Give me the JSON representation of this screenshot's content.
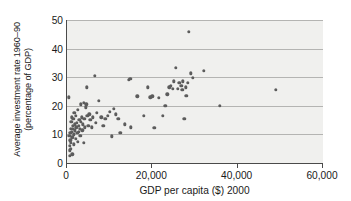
{
  "chart_data": {
    "type": "scatter",
    "title": "",
    "xlabel": "GDP per capita ($) 2000",
    "ylabel_line1": "Average investment rate 1960–90",
    "ylabel_line2": "(percentage of GDP)",
    "xlim": [
      0,
      60000
    ],
    "ylim": [
      0,
      50
    ],
    "xticks": [
      0,
      20000,
      40000,
      60000
    ],
    "xtick_labels": [
      "0",
      "20,000",
      "40,000",
      "60,000"
    ],
    "yticks": [
      0,
      10,
      20,
      30,
      40,
      50
    ],
    "ytick_labels": [
      "0",
      "10",
      "20",
      "30",
      "40",
      "50"
    ],
    "grid": "horizontal",
    "legend": "none",
    "plot_background": "#f0f0ee",
    "marker_color": "#5c5c5c",
    "gridline_color": "#b4b4b2",
    "axis_color": "#4a4a4a",
    "points": [
      [
        400,
        23.0
      ],
      [
        500,
        9.5
      ],
      [
        600,
        6.0
      ],
      [
        650,
        4.5
      ],
      [
        700,
        2.5
      ],
      [
        750,
        10.5
      ],
      [
        800,
        8.0
      ],
      [
        850,
        12.0
      ],
      [
        900,
        5.0
      ],
      [
        950,
        7.0
      ],
      [
        1000,
        14.5
      ],
      [
        1100,
        11.0
      ],
      [
        1150,
        16.0
      ],
      [
        1200,
        9.0
      ],
      [
        1250,
        3.0
      ],
      [
        1300,
        13.0
      ],
      [
        1400,
        12.0
      ],
      [
        1500,
        15.5
      ],
      [
        1550,
        10.0
      ],
      [
        1600,
        6.5
      ],
      [
        1700,
        17.5
      ],
      [
        1800,
        11.5
      ],
      [
        1900,
        13.5
      ],
      [
        2000,
        8.5
      ],
      [
        2100,
        16.5
      ],
      [
        2200,
        12.5
      ],
      [
        2300,
        14.0
      ],
      [
        2400,
        10.5
      ],
      [
        2500,
        7.5
      ],
      [
        2600,
        18.5
      ],
      [
        2700,
        13.0
      ],
      [
        2800,
        11.0
      ],
      [
        2900,
        15.0
      ],
      [
        3000,
        12.0
      ],
      [
        3100,
        9.5
      ],
      [
        3200,
        20.5
      ],
      [
        3300,
        14.5
      ],
      [
        3500,
        16.0
      ],
      [
        3600,
        11.5
      ],
      [
        3700,
        13.5
      ],
      [
        3900,
        21.0
      ],
      [
        4000,
        7.0
      ],
      [
        4100,
        15.5
      ],
      [
        4200,
        12.5
      ],
      [
        4400,
        19.5
      ],
      [
        4500,
        20.5
      ],
      [
        4700,
        26.5
      ],
      [
        4800,
        16.5
      ],
      [
        5000,
        13.0
      ],
      [
        5200,
        17.0
      ],
      [
        5500,
        15.0
      ],
      [
        5800,
        12.5
      ],
      [
        6000,
        16.0
      ],
      [
        6500,
        30.5
      ],
      [
        6800,
        14.0
      ],
      [
        7000,
        17.5
      ],
      [
        7500,
        21.8
      ],
      [
        8000,
        16.0
      ],
      [
        8500,
        13.0
      ],
      [
        9000,
        15.5
      ],
      [
        9500,
        16.5
      ],
      [
        10000,
        18.0
      ],
      [
        10500,
        9.3
      ],
      [
        11000,
        19.0
      ],
      [
        11500,
        17.0
      ],
      [
        12000,
        15.5
      ],
      [
        12500,
        10.5
      ],
      [
        13500,
        13.5
      ],
      [
        14500,
        29.0
      ],
      [
        14800,
        29.5
      ],
      [
        15000,
        12.5
      ],
      [
        16500,
        23.3
      ],
      [
        18000,
        16.5
      ],
      [
        19000,
        26.5
      ],
      [
        19500,
        23.0
      ],
      [
        20000,
        23.3
      ],
      [
        20500,
        12.3
      ],
      [
        21500,
        22.8
      ],
      [
        22500,
        16.5
      ],
      [
        23000,
        20.0
      ],
      [
        23500,
        24.0
      ],
      [
        24000,
        26.5
      ],
      [
        24300,
        27.0
      ],
      [
        24800,
        26.0
      ],
      [
        25000,
        28.5
      ],
      [
        25500,
        33.3
      ],
      [
        26000,
        26.0
      ],
      [
        26300,
        28.0
      ],
      [
        26800,
        27.0
      ],
      [
        27000,
        25.5
      ],
      [
        27200,
        28.5
      ],
      [
        27500,
        15.5
      ],
      [
        27800,
        26.5
      ],
      [
        28000,
        23.5
      ],
      [
        28300,
        28.0
      ],
      [
        28500,
        45.8
      ],
      [
        29000,
        31.3
      ],
      [
        29500,
        29.8
      ],
      [
        32000,
        32.2
      ],
      [
        35800,
        20.0
      ],
      [
        49000,
        25.5
      ]
    ]
  }
}
